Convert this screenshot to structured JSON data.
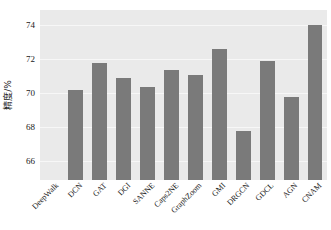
{
  "chart_data": {
    "type": "bar",
    "title": "",
    "xlabel": "",
    "ylabel": "精度/%",
    "categories": [
      "DeepWalk",
      "DCN",
      "GAT",
      "DGI",
      "SANNE",
      "Caps2NE",
      "GraphZoom",
      "GMI",
      "DRGCN",
      "GDCL",
      "AGN",
      "CNAM"
    ],
    "values": [
      null,
      70.2,
      71.8,
      70.9,
      70.4,
      71.35,
      71.1,
      72.6,
      67.8,
      71.9,
      69.8,
      74.0
    ],
    "ylim": [
      64.9,
      74.9
    ],
    "yticks": [
      66,
      68,
      70,
      72,
      74
    ],
    "ytick_labels": [
      "66",
      "68",
      "70",
      "72",
      "74"
    ],
    "grid": true,
    "legend": null,
    "bar_color": "#7a7a7a",
    "plot_background": "#eaeaea",
    "grid_color": "#f7f7f7",
    "figure_background": "#ffffff",
    "note_first_category_no_bar": "DeepWalk has no bar drawn in the plot area"
  }
}
